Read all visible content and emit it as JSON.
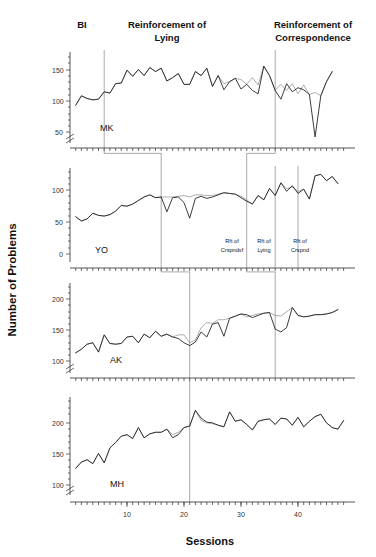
{
  "chart_data": {
    "type": "line",
    "title": "",
    "xlabel": "Sessions",
    "ylabel": "Number of Problems",
    "xlim": [
      0,
      50
    ],
    "xticks": [
      10,
      20,
      30,
      40
    ],
    "grid": false,
    "legend": "none",
    "phase_headers": [
      {
        "label": "BI",
        "x": 3
      },
      {
        "label": "Reinforcement of Lying",
        "line1": "Reinforcement of",
        "line2": "Lying",
        "x": 18
      },
      {
        "label": "Reinforcement of Correspondence",
        "line1": "Reinforcement of",
        "line2": "Correspondence",
        "x": 42
      }
    ],
    "panels": [
      {
        "subject": "MK",
        "ylim": [
          40,
          175
        ],
        "yticks": [
          50,
          100,
          150
        ],
        "axis_break": true,
        "phase_lines": [
          6,
          36
        ],
        "phase_labels": [],
        "series": [
          {
            "name": "Reported",
            "x": [
              1,
              2,
              3,
              4,
              5,
              6,
              7,
              8,
              9,
              10,
              11,
              12,
              13,
              14,
              15,
              16,
              17,
              18,
              19,
              20,
              21,
              22,
              23,
              24,
              25,
              26,
              27,
              28,
              29,
              30,
              31,
              32,
              33,
              34,
              35,
              36,
              37,
              38,
              39,
              40,
              41,
              42,
              43,
              44,
              45,
              46
            ],
            "values": [
              96,
              110,
              106,
              104,
              105,
              116,
              114,
              128,
              129,
              148,
              139,
              149,
              140,
              152,
              146,
              151,
              132,
              137,
              143,
              127,
              127,
              146,
              140,
              151,
              124,
              140,
              119,
              131,
              136,
              120,
              127,
              118,
              113,
              154,
              140,
              118,
              105,
              128,
              116,
              122,
              119,
              112,
              49,
              110,
              131,
              146
            ]
          },
          {
            "name": "Actual",
            "x": [
              1,
              2,
              3,
              4,
              5,
              6,
              7,
              8,
              9,
              10,
              11,
              12,
              13,
              14,
              15,
              16,
              17,
              18,
              19,
              20,
              21,
              22,
              23,
              24,
              25,
              26,
              27,
              28,
              29,
              30,
              31,
              32,
              33,
              34,
              35,
              36,
              37,
              38,
              39,
              40,
              41,
              42,
              43,
              44,
              45,
              46
            ],
            "values": [
              96,
              110,
              106,
              104,
              105,
              116,
              114,
              128,
              129,
              148,
              139,
              149,
              140,
              152,
              146,
              151,
              132,
              137,
              143,
              127,
              127,
              146,
              140,
              151,
              124,
              140,
              128,
              131,
              136,
              134,
              127,
              137,
              126,
              154,
              140,
              118,
              127,
              118,
              128,
              113,
              126,
              112,
              115,
              110,
              131,
              146
            ]
          }
        ]
      },
      {
        "subject": "YO",
        "ylim": [
          -8,
          125
        ],
        "yticks": [
          0,
          50,
          100
        ],
        "axis_break": false,
        "phase_lines": [
          16,
          31,
          36,
          40
        ],
        "phase_labels": [
          {
            "line1": "Rft of",
            "line2": "Crspndvf",
            "x": 33.5
          },
          {
            "line1": "Rft of",
            "line2": "Lying",
            "x": 38
          },
          {
            "line1": "Rft of",
            "line2": "Crspnd",
            "x": 44
          }
        ],
        "series": [
          {
            "name": "Reported",
            "x": [
              1,
              2,
              3,
              4,
              5,
              6,
              7,
              8,
              9,
              10,
              11,
              12,
              13,
              14,
              15,
              16,
              17,
              18,
              19,
              20,
              21,
              22,
              23,
              24,
              25,
              26,
              27,
              28,
              29,
              30,
              31,
              32,
              33,
              34,
              35,
              36,
              37,
              38,
              39,
              40,
              41,
              42,
              43,
              44,
              45,
              46,
              47
            ],
            "values": [
              56,
              50,
              53,
              61,
              58,
              57,
              59,
              64,
              72,
              71,
              74,
              79,
              84,
              87,
              83,
              84,
              63,
              83,
              84,
              76,
              54,
              82,
              85,
              82,
              84,
              87,
              90,
              89,
              88,
              83,
              78,
              74,
              86,
              80,
              96,
              86,
              104,
              92,
              100,
              89,
              95,
              81,
              114,
              116,
              107,
              113,
              103
            ]
          },
          {
            "name": "Actual",
            "x": [
              1,
              2,
              3,
              4,
              5,
              6,
              7,
              8,
              9,
              10,
              11,
              12,
              13,
              14,
              15,
              16,
              17,
              18,
              19,
              20,
              21,
              22,
              23,
              24,
              25,
              26,
              27,
              28,
              29,
              30,
              31,
              32,
              33,
              34,
              35,
              36,
              37,
              38,
              39,
              40,
              41,
              42,
              43,
              44,
              45,
              46,
              47
            ],
            "values": [
              56,
              50,
              53,
              61,
              58,
              57,
              59,
              64,
              72,
              71,
              74,
              79,
              84,
              87,
              83,
              84,
              84,
              84,
              85,
              86,
              84,
              87,
              87,
              86,
              86,
              88,
              90,
              89,
              88,
              85,
              80,
              74,
              86,
              80,
              96,
              86,
              104,
              96,
              98,
              92,
              95,
              81,
              114,
              116,
              107,
              113,
              103
            ]
          }
        ]
      },
      {
        "subject": "AK",
        "ylim": [
          90,
          215
        ],
        "yticks": [
          100,
          150,
          200
        ],
        "axis_break": true,
        "phase_lines": [
          21,
          36
        ],
        "phase_labels": [],
        "series": [
          {
            "name": "Reported",
            "x": [
              1,
              2,
              3,
              4,
              5,
              6,
              7,
              8,
              9,
              10,
              11,
              12,
              13,
              14,
              15,
              16,
              17,
              18,
              19,
              20,
              21,
              22,
              23,
              24,
              25,
              26,
              27,
              28,
              29,
              30,
              31,
              32,
              33,
              34,
              35,
              36,
              37,
              38,
              39,
              40,
              41,
              42,
              43,
              44,
              45,
              46,
              47
            ],
            "values": [
              118,
              123,
              130,
              132,
              119,
              143,
              131,
              130,
              131,
              140,
              141,
              132,
              144,
              139,
              148,
              141,
              144,
              140,
              138,
              132,
              128,
              133,
              147,
              140,
              158,
              160,
              141,
              166,
              169,
              172,
              171,
              167,
              170,
              173,
              174,
              151,
              147,
              153,
              181,
              170,
              168,
              169,
              171,
              171,
              172,
              174,
              178
            ]
          },
          {
            "name": "Actual",
            "x": [
              1,
              2,
              3,
              4,
              5,
              6,
              7,
              8,
              9,
              10,
              11,
              12,
              13,
              14,
              15,
              16,
              17,
              18,
              19,
              20,
              21,
              22,
              23,
              24,
              25,
              26,
              27,
              28,
              29,
              30,
              31,
              32,
              33,
              34,
              35,
              36,
              37,
              38,
              39,
              40,
              41,
              42,
              43,
              44,
              45,
              46,
              47
            ],
            "values": [
              118,
              123,
              130,
              132,
              119,
              143,
              131,
              130,
              131,
              140,
              141,
              132,
              144,
              139,
              148,
              141,
              144,
              140,
              143,
              143,
              132,
              136,
              153,
              160,
              159,
              164,
              164,
              166,
              169,
              172,
              168,
              170,
              172,
              173,
              174,
              170,
              169,
              175,
              181,
              170,
              168,
              169,
              171,
              171,
              172,
              174,
              178
            ]
          }
        ]
      },
      {
        "subject": "MH",
        "ylim": [
          90,
          215
        ],
        "yticks": [
          100,
          150,
          200
        ],
        "axis_break": true,
        "phase_lines": [
          21
        ],
        "phase_labels": [],
        "series": [
          {
            "name": "Reported",
            "x": [
              1,
              2,
              3,
              4,
              5,
              6,
              7,
              8,
              9,
              10,
              11,
              12,
              13,
              14,
              15,
              16,
              17,
              18,
              19,
              20,
              21,
              22,
              23,
              24,
              25,
              26,
              27,
              28,
              29,
              30,
              31,
              32,
              33,
              34,
              35,
              36,
              37,
              38,
              39,
              40,
              41,
              42,
              43,
              44,
              45,
              46,
              47,
              48
            ],
            "values": [
              124,
              132,
              135,
              130,
              143,
              131,
              150,
              157,
              165,
              167,
              162,
              176,
              163,
              168,
              170,
              170,
              174,
              163,
              167,
              176,
              178,
              198,
              188,
              183,
              182,
              179,
              177,
              196,
              184,
              186,
              180,
              173,
              184,
              186,
              187,
              180,
              188,
              187,
              179,
              189,
              177,
              184,
              190,
              193,
              182,
              176,
              174,
              185
            ]
          },
          {
            "name": "Actual",
            "x": [
              1,
              2,
              3,
              4,
              5,
              6,
              7,
              8,
              9,
              10,
              11,
              12,
              13,
              14,
              15,
              16,
              17,
              18,
              19,
              20,
              21,
              22,
              23,
              24,
              25,
              26,
              27,
              28,
              29,
              30,
              31,
              32,
              33,
              34,
              35,
              36,
              37,
              38,
              39,
              40,
              41,
              42,
              43,
              44,
              45,
              46,
              47,
              48
            ],
            "values": [
              124,
              132,
              135,
              130,
              143,
              131,
              150,
              157,
              165,
              167,
              162,
              176,
              163,
              168,
              170,
              170,
              174,
              167,
              170,
              176,
              178,
              198,
              185,
              182,
              181,
              179,
              177,
              196,
              184,
              186,
              180,
              173,
              184,
              186,
              187,
              180,
              188,
              187,
              179,
              189,
              177,
              184,
              190,
              193,
              182,
              176,
              174,
              185
            ]
          }
        ]
      }
    ]
  },
  "axes": {
    "ylabel": "Number of Problems",
    "xlabel": "Sessions",
    "xticks": [
      "10",
      "20",
      "30",
      "40"
    ]
  },
  "headers": {
    "bi": "BI",
    "lying_l1": "Reinforcement of",
    "lying_l2": "Lying",
    "corr_l1": "Reinforcement of",
    "corr_l2": "Correspondence"
  },
  "subjects": {
    "mk": "MK",
    "yo": "YO",
    "ak": "AK",
    "mh": "MH"
  },
  "panel_ticks": {
    "mk": [
      "150",
      "100",
      "50"
    ],
    "yo": [
      "100",
      "50",
      "0"
    ],
    "ak": [
      "200",
      "150",
      "100"
    ],
    "mh": [
      "200",
      "150",
      "100"
    ]
  },
  "phase_labels": {
    "yo_a_l1": "Rft of",
    "yo_a_l2": "Crspndvf",
    "yo_b_l1": "Rft of",
    "yo_b_l2": "Lying",
    "yo_c_l1": "Rft of",
    "yo_c_l2": "Crspnd"
  },
  "colors": {
    "series_primary": "#1a1a1a",
    "series_secondary": "#8a8a8a",
    "axis": "#2b2b2b",
    "phase_line": "#6e6e6e"
  }
}
